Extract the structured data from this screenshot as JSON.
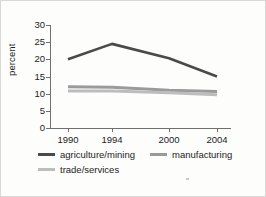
{
  "chart_data": {
    "type": "line",
    "title": "",
    "xlabel": "",
    "ylabel": "percent",
    "categories": [
      "1990",
      "1994",
      "2000",
      "2004"
    ],
    "x_tick_labels": [
      "1990",
      "1994",
      "2000",
      "2004"
    ],
    "y_tick_labels": [
      "30",
      "25",
      "20",
      "15",
      "10",
      "5",
      "0"
    ],
    "y_tick_values": [
      30,
      25,
      20,
      15,
      10,
      5,
      0
    ],
    "ylim": [
      0,
      30
    ],
    "grid": false,
    "legend_position": "bottom",
    "series": [
      {
        "name": "agriculture/mining",
        "values": [
          20.0,
          24.5,
          20.3,
          15.0
        ],
        "color": "#4a4a4a"
      },
      {
        "name": "manufacturing",
        "values": [
          12.0,
          11.9,
          11.0,
          10.6
        ],
        "color": "#9a9a9a"
      },
      {
        "name": "trade/services",
        "values": [
          10.8,
          10.8,
          10.3,
          9.7
        ],
        "color": "#bdbdbd"
      }
    ]
  },
  "axes": {
    "y_title": "percent"
  },
  "legend": {
    "items": [
      {
        "label": "agriculture/mining",
        "color": "#4a4a4a"
      },
      {
        "label": "manufacturing",
        "color": "#9a9a9a"
      },
      {
        "label": "trade/services",
        "color": "#bdbdbd"
      }
    ]
  },
  "colors": {
    "axis": "#6f6f6f",
    "text": "#1c1c1c",
    "background": "#fdfdfc",
    "border": "#d8d8d6"
  }
}
